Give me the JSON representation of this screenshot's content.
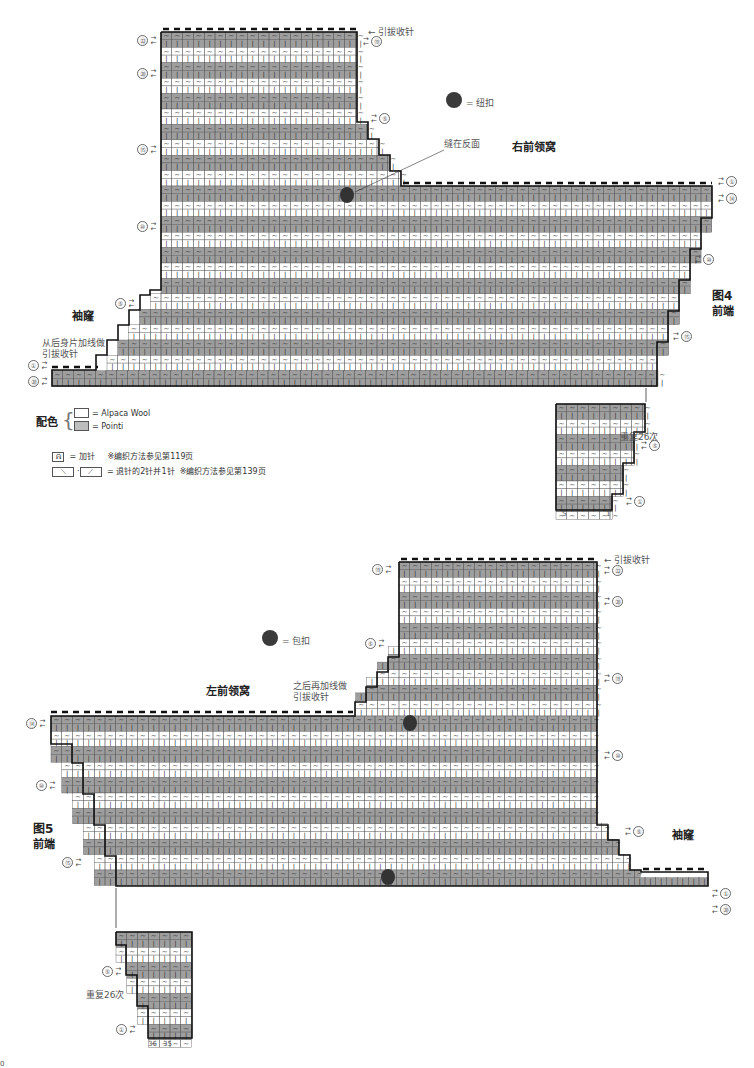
{
  "figure4": {
    "label": "图4",
    "sublabel": "前端",
    "neck_title": "右前领窝",
    "armhole_title": "袖窿",
    "bind_off_top": "引拔收针",
    "sewn_on_back": "缝在反面",
    "from_back_note_line1": "从后身片加线做",
    "from_back_note_line2": "引拔收针",
    "button_legend": "= 纽扣",
    "repeat_note": "重复26次",
    "row_markers": {
      "left": [
        "㉒",
        "⑳",
        "⑮",
        "⑩",
        "⑤",
        "①",
        "⑳"
      ],
      "right": [
        "⑲",
        "⑤",
        "①",
        "⑭",
        "⑩",
        "⑮"
      ],
      "right_top": [
        "⑲"
      ],
      "bottom_stitch_numbers": [
        "5",
        "1"
      ],
      "repeat_rows": [
        "⑤",
        "①"
      ]
    }
  },
  "figure5": {
    "label": "图5",
    "sublabel": "前端",
    "neck_title": "左前领窝",
    "armhole_title": "袖窿",
    "bind_off_top": "引拔收针",
    "after_note_line1": "之后再加线做",
    "after_note_line2": "引拔收针",
    "button_legend": "= 包扣",
    "repeat_note": "重复26次",
    "row_markers": {
      "left": [
        "⑲",
        "⑤",
        "⑭",
        "⑩",
        "⑮",
        "⑤",
        "①"
      ],
      "right": [
        "㉒",
        "⑳",
        "⑲",
        "⑩",
        "⑤",
        "①",
        "⑳"
      ],
      "bottom_stitch_numbers": [
        "36",
        "35"
      ]
    }
  },
  "legend": {
    "color_title": "配色",
    "colors": [
      {
        "swatch": "#ffffff",
        "label": "= Alpaca Wool"
      },
      {
        "swatch": "#bdbdbd",
        "label": "= Pointi"
      }
    ],
    "symbols": [
      {
        "icon": "increase-stitch-icon",
        "label": "= 加针",
        "note": "※编织方法参见第119页"
      },
      {
        "icon": "decrease-2-into-1-icon",
        "label": "= 退针的2针并1针",
        "note": "※编织方法参见第139页"
      }
    ]
  },
  "page_marker": "0",
  "colors": {
    "dark_row": "#9e9e9e",
    "light_row": "#ffffff",
    "mid_row": "#cfcfcf",
    "outline": "#111111",
    "grid": "#555555",
    "button": "#333333"
  }
}
